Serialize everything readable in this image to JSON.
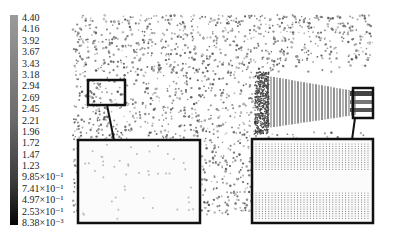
{
  "figure": {
    "type": "particle-velocity-contour"
  },
  "colorbar": {
    "orientation": "vertical",
    "position": "left",
    "color_top": "#9a9a9a",
    "color_bottom": "#0a0a0a",
    "labels": [
      "4.40",
      "4.16",
      "3.92",
      "3.67",
      "3.43",
      "3.18",
      "2.94",
      "2.69",
      "2.45",
      "2.21",
      "1.96",
      "1.72",
      "1.47",
      "1.23",
      "9.85×10⁻¹",
      "7.41×10⁻¹",
      "4.97×10⁻¹",
      "2.53×10⁻¹",
      "8.38×10⁻³"
    ]
  },
  "insets": [
    {
      "name": "left-source-box",
      "target": "left-magnified-box"
    },
    {
      "name": "right-source-box",
      "target": "right-magnified-box"
    }
  ],
  "colors": {
    "frame": "#111111",
    "particle_dark": "#555555",
    "particle_light": "#b0b0b0",
    "background": "#ffffff"
  }
}
